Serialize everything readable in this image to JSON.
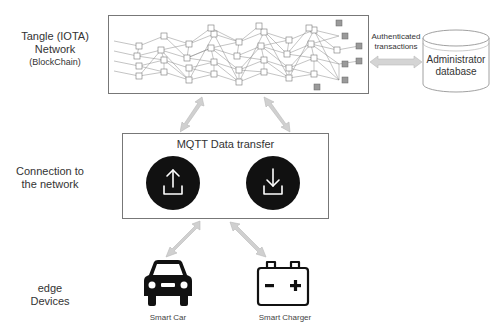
{
  "layers": [
    {
      "id": "network",
      "line1": "Tangle (IOTA)",
      "line2": "Network",
      "line3": "(BlockChain)"
    },
    {
      "id": "connection",
      "line1": "Connection to",
      "line2": "the network"
    },
    {
      "id": "edge",
      "line1": "edge",
      "line2": "Devices"
    }
  ],
  "tangle": {
    "name": "Tangle DAG graph"
  },
  "mqtt": {
    "title": "MQTT Data transfer",
    "upload_icon": "upload-icon",
    "download_icon": "download-icon"
  },
  "database": {
    "line1": "Administrator",
    "line2": "database"
  },
  "link_label": {
    "line1": "Authenticated",
    "line2": "transactions"
  },
  "devices": [
    {
      "label": "Smart Car",
      "icon": "car-icon"
    },
    {
      "label": "Smart Charger",
      "icon": "battery-icon"
    }
  ],
  "colors": {
    "arrow": "#c8c8c8",
    "icon_fill": "#111111",
    "box_border": "#777777",
    "tip_node": "#9a9a9a"
  }
}
